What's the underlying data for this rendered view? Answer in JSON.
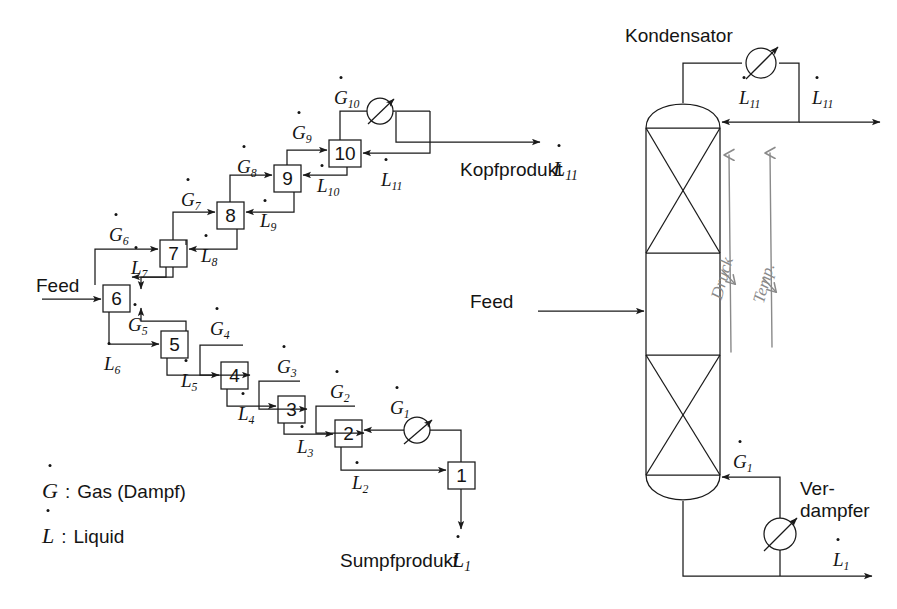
{
  "diagram": {
    "feed_label": "Feed",
    "feed_label_column": "Feed",
    "top_product_label": "Kopfprodukt",
    "bottom_product_label": "Sumpfprodukt",
    "condenser_label": "Kondensator",
    "reboiler_label_line1": "Ver-",
    "reboiler_label_line2": "dampfer"
  },
  "legend": {
    "items": [
      {
        "symbol": "G",
        "dot": true,
        "colon": ":",
        "text": "Gas (Dampf)"
      },
      {
        "symbol": "L",
        "dot": true,
        "colon": ":",
        "text": "Liquid"
      }
    ]
  },
  "stages": [
    {
      "id": "stage-1",
      "number": "1",
      "x": 448,
      "y": 462
    },
    {
      "id": "stage-2",
      "number": "2",
      "x": 335,
      "y": 420
    },
    {
      "id": "stage-3",
      "number": "3",
      "x": 278,
      "y": 396
    },
    {
      "id": "stage-4",
      "number": "4",
      "x": 221,
      "y": 362
    },
    {
      "id": "stage-5",
      "number": "5",
      "x": 161,
      "y": 331
    },
    {
      "id": "stage-6",
      "number": "6",
      "x": 103,
      "y": 285
    },
    {
      "id": "stage-7",
      "number": "7",
      "x": 160,
      "y": 240
    },
    {
      "id": "stage-8",
      "number": "8",
      "x": 217,
      "y": 202
    },
    {
      "id": "stage-9",
      "number": "9",
      "x": 274,
      "y": 165
    },
    {
      "id": "stage-10",
      "number": "10",
      "x": 329,
      "y": 140
    }
  ],
  "stream_labels": {
    "gas": [
      {
        "name": "G1",
        "base": "G",
        "sub": "1",
        "x": 390,
        "y": 398
      },
      {
        "name": "G2",
        "base": "G",
        "sub": "2",
        "x": 330,
        "y": 382
      },
      {
        "name": "G3",
        "base": "G",
        "sub": "3",
        "x": 277,
        "y": 357
      },
      {
        "name": "G4",
        "base": "G",
        "sub": "4",
        "x": 210,
        "y": 319
      },
      {
        "name": "G5",
        "base": "G",
        "sub": "5",
        "x": 128,
        "y": 315
      },
      {
        "name": "G6",
        "base": "G",
        "sub": "6",
        "x": 109,
        "y": 225
      },
      {
        "name": "G7",
        "base": "G",
        "sub": "7",
        "x": 181,
        "y": 190
      },
      {
        "name": "G8",
        "base": "G",
        "sub": "8",
        "x": 237,
        "y": 157
      },
      {
        "name": "G9",
        "base": "G",
        "sub": "9",
        "x": 292,
        "y": 123
      },
      {
        "name": "G10",
        "base": "G",
        "sub": "10",
        "x": 337,
        "y": 88
      },
      {
        "name": "G1-column",
        "base": "G",
        "sub": "1",
        "x": 733,
        "y": 455
      }
    ],
    "liquid": [
      {
        "name": "L2",
        "base": "L",
        "sub": "2",
        "x": 355,
        "y": 473
      },
      {
        "name": "L3",
        "base": "L",
        "sub": "3",
        "x": 300,
        "y": 437
      },
      {
        "name": "L4",
        "base": "L",
        "sub": "4",
        "x": 240,
        "y": 403
      },
      {
        "name": "L5",
        "base": "L",
        "sub": "5",
        "x": 183,
        "y": 370
      },
      {
        "name": "L6",
        "base": "L",
        "sub": "6",
        "x": 103,
        "y": 354
      },
      {
        "name": "L7",
        "base": "L",
        "sub": "7",
        "x": 131,
        "y": 258
      },
      {
        "name": "L8",
        "base": "L",
        "sub": "8",
        "x": 203,
        "y": 245
      },
      {
        "name": "L9",
        "base": "L",
        "sub": "9",
        "x": 262,
        "y": 210
      },
      {
        "name": "L10",
        "base": "L",
        "sub": "10",
        "x": 318,
        "y": 175
      },
      {
        "name": "L11",
        "base": "L",
        "sub": "11",
        "x": 384,
        "y": 170
      },
      {
        "name": "L11-reflux",
        "base": "L",
        "sub": "11",
        "x": 742,
        "y": 92
      },
      {
        "name": "L11-distillate",
        "base": "L",
        "sub": "11",
        "x": 815,
        "y": 92
      },
      {
        "name": "L1-bottoms",
        "base": "L",
        "sub": "1",
        "x": 836,
        "y": 553
      }
    ],
    "products": [
      {
        "name": "Kopfprodukt-L11",
        "base": "L",
        "sub": "11",
        "x": 550,
        "y": 157
      },
      {
        "name": "Sumpfprodukt-L1",
        "base": "L",
        "sub": "1",
        "x": 447,
        "y": 549
      }
    ]
  },
  "column": {
    "annotations": [
      {
        "name": "druck",
        "text": "Druck",
        "x": 715,
        "y": 300
      },
      {
        "name": "temp",
        "text": "Temp.",
        "x": 757,
        "y": 300
      }
    ]
  },
  "colors": {
    "line": "#1a1a1a",
    "hand": "#8a8a8a",
    "text": "#141414",
    "background": "#ffffff"
  }
}
